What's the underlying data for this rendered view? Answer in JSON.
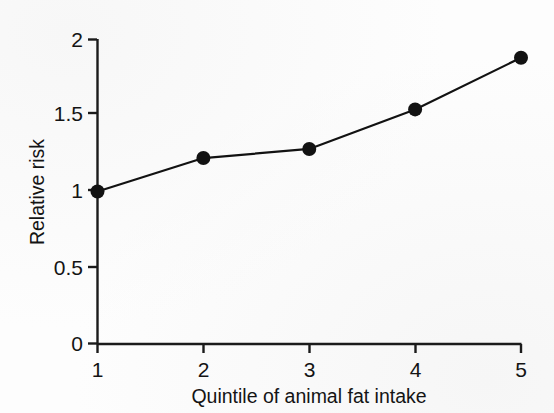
{
  "figure": {
    "background_color": "#fdfdfd",
    "ink_color": "#141414"
  },
  "chart_data": {
    "type": "line",
    "title": "",
    "subtitle": "",
    "xlabel": "Quintile of animal fat intake",
    "ylabel": "Relative risk",
    "x": [
      1,
      2,
      3,
      4,
      5
    ],
    "categories": [
      "1",
      "2",
      "3",
      "4",
      "5"
    ],
    "values": [
      1.0,
      1.22,
      1.28,
      1.54,
      1.88
    ],
    "series": [
      {
        "name": "Relative risk",
        "values": [
          1.0,
          1.22,
          1.28,
          1.54,
          1.88
        ]
      }
    ],
    "xlim": [
      1,
      5
    ],
    "ylim": [
      0,
      2
    ],
    "xticks": [
      1,
      2,
      3,
      4,
      5
    ],
    "yticks": [
      0,
      0.5,
      1,
      1.5,
      2
    ],
    "xticklabels": [
      "1",
      "2",
      "3",
      "4",
      "5"
    ],
    "yticklabels": [
      "0",
      "0.5",
      "1",
      "1.5",
      "2"
    ],
    "grid": false,
    "legend": false,
    "legend_position": "none",
    "marker": "filled-circle",
    "marker_color": "#121212",
    "line_color": "#121212",
    "annotations": []
  },
  "axes": {
    "x_tick_labels": [
      "1",
      "2",
      "3",
      "4",
      "5"
    ],
    "y_tick_labels": [
      "0",
      "0.5",
      "1",
      "1.5",
      "2"
    ],
    "x_axis_title": "Quintile of animal fat intake",
    "y_axis_title": "Relative risk"
  }
}
